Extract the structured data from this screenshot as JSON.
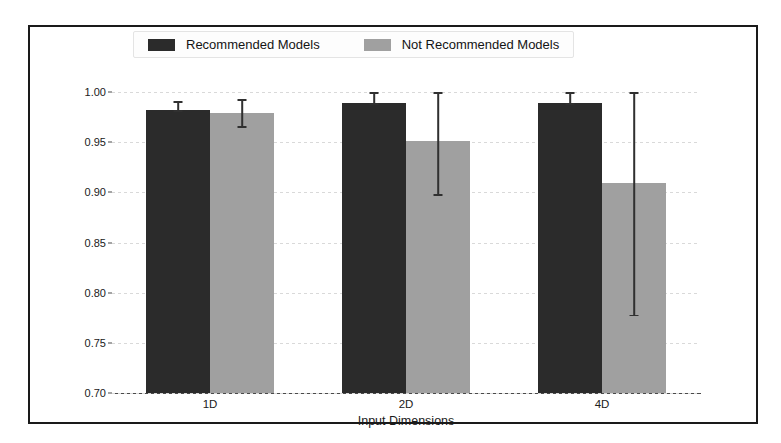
{
  "chart_data": {
    "type": "bar",
    "title": "",
    "xlabel": "Input Dimensions",
    "ylabel": "Adjusted R-Squared",
    "categories": [
      "1D",
      "2D",
      "4D"
    ],
    "ylim": [
      0.7,
      1.0
    ],
    "yticks": [
      "0.70",
      "0.75",
      "0.80",
      "0.85",
      "0.90",
      "0.95",
      "1.00"
    ],
    "ytick_values": [
      0.7,
      0.75,
      0.8,
      0.85,
      0.9,
      0.95,
      1.0
    ],
    "grid": true,
    "legend_position": "upper center",
    "series": [
      {
        "name": "Recommended Models",
        "color": "#2b2b2b",
        "values": [
          0.982,
          0.989,
          0.989
        ],
        "errors_upper": [
          0.991,
          1.0,
          1.0
        ],
        "errors_lower": [
          0.982,
          0.989,
          0.989
        ]
      },
      {
        "name": "Not Recommended Models",
        "color": "#a0a0a0",
        "values": [
          0.979,
          0.951,
          0.909
        ],
        "errors_upper": [
          0.993,
          1.0,
          1.0
        ],
        "errors_lower": [
          0.966,
          0.898,
          0.778
        ]
      }
    ]
  },
  "legend": {
    "items": [
      {
        "label": "Recommended Models",
        "color": "#2b2b2b"
      },
      {
        "label": "Not Recommended Models",
        "color": "#a0a0a0"
      }
    ]
  },
  "axes": {
    "ylabel": "Adjusted R-Squared",
    "xlabel": "Input Dimensions"
  }
}
